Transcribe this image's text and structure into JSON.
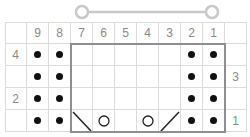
{
  "slider": {
    "left_handle_x": 82,
    "right_handle_x": 212,
    "y": 12,
    "color": "#c8c8c8"
  },
  "chart": {
    "column_numbers": [
      "9",
      "8",
      "7",
      "6",
      "5",
      "4",
      "3",
      "2",
      "1"
    ],
    "rows": [
      {
        "row": 4,
        "left_label": "4",
        "right_label": "",
        "cells": [
          "purl",
          "purl",
          "knit",
          "knit",
          "knit",
          "knit",
          "knit",
          "purl",
          "purl"
        ]
      },
      {
        "row": 3,
        "left_label": "",
        "right_label": "3",
        "cells": [
          "purl",
          "purl",
          "knit",
          "knit",
          "knit",
          "knit",
          "knit",
          "purl",
          "purl"
        ]
      },
      {
        "row": 2,
        "left_label": "2",
        "right_label": "",
        "cells": [
          "purl",
          "purl",
          "knit",
          "knit",
          "knit",
          "knit",
          "knit",
          "purl",
          "purl"
        ]
      },
      {
        "row": 1,
        "left_label": "",
        "right_label": "1",
        "cells": [
          "purl",
          "purl",
          "ssk",
          "yo",
          "knit",
          "yo",
          "k2tog",
          "purl",
          "purl"
        ]
      }
    ],
    "repeat_box": {
      "from_column": "7",
      "to_column": "1",
      "from_row": 4,
      "to_row": 1,
      "color": "#8f8f8f"
    },
    "symbols": {
      "purl": "bullet-dot-icon",
      "knit": "blank",
      "yo": "circle-yarn-over-icon",
      "ssk": "backslash-decrease-icon",
      "k2tog": "slash-decrease-icon"
    },
    "grid_line_color": "#dcdcdc",
    "label_color": "#8a8a8a"
  }
}
